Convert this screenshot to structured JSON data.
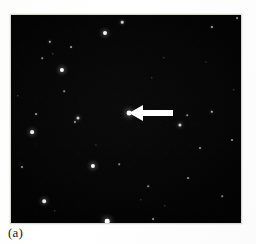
{
  "figure": {
    "panel_label": "(a)",
    "type": "astronomical-star-field-image",
    "frame": {
      "x": 11,
      "y": 15,
      "width": 230,
      "height": 208
    },
    "background_color": "#050505",
    "star_color": "#ffffff",
    "annotation_color": "#ffffff",
    "page_color": "#ffffff"
  },
  "annotation": {
    "arrow": {
      "name": "target-arrow",
      "direction": "left",
      "tip_x": 129,
      "tip_y": 113,
      "tail_x": 171,
      "tail_y": 113,
      "length": 42,
      "head_width": 15,
      "shaft_height": 5,
      "color": "#ffffff"
    },
    "target_star": {
      "name": "arrow-marked-star",
      "x": 129,
      "y": 113,
      "radius": 2.4,
      "brightness": 1.0
    }
  },
  "stars": [
    {
      "x": 105,
      "y": 33,
      "r": 2.0,
      "b": 0.95
    },
    {
      "x": 122,
      "y": 22,
      "r": 1.3,
      "b": 0.7
    },
    {
      "x": 62,
      "y": 70,
      "r": 2.1,
      "b": 0.98
    },
    {
      "x": 50,
      "y": 42,
      "r": 1.2,
      "b": 0.62
    },
    {
      "x": 71,
      "y": 47,
      "r": 0.9,
      "b": 0.45
    },
    {
      "x": 42,
      "y": 58,
      "r": 0.8,
      "b": 0.38
    },
    {
      "x": 53,
      "y": 54,
      "r": 0.7,
      "b": 0.33
    },
    {
      "x": 64,
      "y": 91,
      "r": 0.8,
      "b": 0.36
    },
    {
      "x": 212,
      "y": 27,
      "r": 1.1,
      "b": 0.58
    },
    {
      "x": 237,
      "y": 18,
      "r": 0.9,
      "b": 0.42
    },
    {
      "x": 129,
      "y": 113,
      "r": 2.4,
      "b": 1.0
    },
    {
      "x": 212,
      "y": 112,
      "r": 1.2,
      "b": 0.62
    },
    {
      "x": 187,
      "y": 115,
      "r": 0.8,
      "b": 0.34
    },
    {
      "x": 164,
      "y": 58,
      "r": 0.7,
      "b": 0.3
    },
    {
      "x": 36,
      "y": 114,
      "r": 0.9,
      "b": 0.44
    },
    {
      "x": 78,
      "y": 118,
      "r": 1.5,
      "b": 0.72
    },
    {
      "x": 32,
      "y": 132,
      "r": 1.9,
      "b": 0.9
    },
    {
      "x": 75,
      "y": 122,
      "r": 1.1,
      "b": 0.52
    },
    {
      "x": 22,
      "y": 167,
      "r": 1.0,
      "b": 0.48
    },
    {
      "x": 93,
      "y": 166,
      "r": 2.1,
      "b": 0.96
    },
    {
      "x": 119,
      "y": 164,
      "r": 0.8,
      "b": 0.34
    },
    {
      "x": 44,
      "y": 201,
      "r": 1.8,
      "b": 0.88
    },
    {
      "x": 55,
      "y": 211,
      "r": 0.7,
      "b": 0.3
    },
    {
      "x": 107,
      "y": 221,
      "r": 2.3,
      "b": 1.0
    },
    {
      "x": 153,
      "y": 219,
      "r": 0.9,
      "b": 0.4
    },
    {
      "x": 180,
      "y": 125,
      "r": 1.6,
      "b": 0.78
    },
    {
      "x": 188,
      "y": 178,
      "r": 0.9,
      "b": 0.4
    },
    {
      "x": 200,
      "y": 148,
      "r": 1.0,
      "b": 0.46
    },
    {
      "x": 232,
      "y": 140,
      "r": 1.0,
      "b": 0.45
    },
    {
      "x": 148,
      "y": 186,
      "r": 0.8,
      "b": 0.36
    },
    {
      "x": 141,
      "y": 200,
      "r": 0.7,
      "b": 0.28
    },
    {
      "x": 165,
      "y": 206,
      "r": 0.7,
      "b": 0.28
    },
    {
      "x": 222,
      "y": 196,
      "r": 0.8,
      "b": 0.33
    },
    {
      "x": 234,
      "y": 90,
      "r": 0.7,
      "b": 0.3
    },
    {
      "x": 152,
      "y": 78,
      "r": 0.7,
      "b": 0.26
    },
    {
      "x": 96,
      "y": 145,
      "r": 0.6,
      "b": 0.24
    },
    {
      "x": 18,
      "y": 96,
      "r": 0.7,
      "b": 0.28
    },
    {
      "x": 206,
      "y": 62,
      "r": 0.6,
      "b": 0.24
    }
  ]
}
